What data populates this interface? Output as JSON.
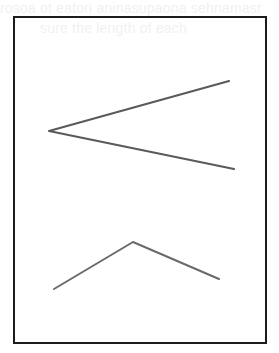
{
  "page": {
    "background_color": "#ffffff",
    "bleed_through_text": {
      "line1": "rosoa ot eaton aninasupaona sehnamasr",
      "line2": "sure the length of each",
      "line3": "",
      "line4": ""
    }
  },
  "frame": {
    "x": 13,
    "y": 16,
    "width": 254,
    "height": 328,
    "stroke_color": "#1c1c1c",
    "stroke_width": 2
  },
  "figures": [
    {
      "name": "angle-1",
      "description": "acute angle opening to the right",
      "vertex": [
        49,
        131
      ],
      "ray_a_end": [
        229,
        81
      ],
      "ray_b_end": [
        234,
        169
      ],
      "stroke_color": "#5a5a5a",
      "stroke_width": 2.2
    },
    {
      "name": "angle-2",
      "description": "obtuse angle opening downward",
      "vertex": [
        133,
        242
      ],
      "ray_a_end": [
        54,
        289
      ],
      "ray_b_end": [
        219,
        279
      ],
      "stroke_color": "#6a6a6a",
      "stroke_width": 2
    }
  ]
}
